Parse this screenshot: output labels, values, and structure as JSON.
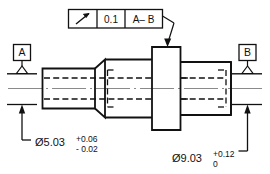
{
  "drawing": {
    "title": "Shaft with circular runout control",
    "colors": {
      "object_line": "#111111",
      "hidden_line": "#111111",
      "center_line": "#8a8a8a",
      "dimension_line": "#111111",
      "background": "#ffffff"
    },
    "feature_control_frame": {
      "name": "circular-runout-frame",
      "symbol_name": "circular-runout-icon",
      "symbol_glyph": "↗",
      "tolerance_value": "0.1",
      "datum_reference": "A– B",
      "cells": [
        "↗",
        "0.1",
        "A– B"
      ]
    },
    "datums": [
      {
        "name": "datum-feature-a",
        "label": "A",
        "position": "left"
      },
      {
        "name": "datum-feature-b",
        "label": "B",
        "position": "right"
      }
    ],
    "dimensions": [
      {
        "name": "diameter-left-shaft",
        "diameter_symbol": "Ø",
        "nominal": "5.03",
        "upper_tolerance": "+0.06",
        "lower_tolerance": "- 0.02",
        "full_text": "Ø5.03 +0.06 / - 0.02"
      },
      {
        "name": "diameter-right-shaft",
        "diameter_symbol": "Ø",
        "nominal": "9.03",
        "upper_tolerance": "+0.12",
        "lower_tolerance": "0",
        "full_text": "Ø9.03 +0.12 / 0"
      }
    ]
  }
}
